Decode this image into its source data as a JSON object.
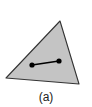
{
  "diagram": {
    "caption": "(a)",
    "triangle": {
      "vertices": [
        [
          60,
          21
        ],
        [
          6,
          78
        ],
        [
          79,
          84
        ]
      ],
      "fill": "#c4c4c4",
      "stroke": "#333333"
    },
    "segment": {
      "endpoints": [
        [
          32,
          65
        ],
        [
          59,
          61
        ]
      ],
      "color": "#000000",
      "dot_radius": 2.6
    }
  }
}
